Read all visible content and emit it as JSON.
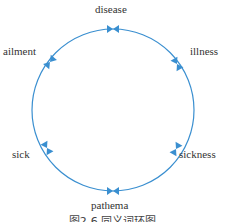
{
  "diagram": {
    "type": "synonym-ring",
    "ring_color": "#3a8fd0",
    "arrow_color": "#3a8fd0",
    "nodes": [
      {
        "label": "disease"
      },
      {
        "label": "illness"
      },
      {
        "label": "sickness"
      },
      {
        "label": "pathema"
      },
      {
        "label": "sick"
      },
      {
        "label": "ailment"
      }
    ],
    "caption": "图2-6 同义词环图"
  }
}
